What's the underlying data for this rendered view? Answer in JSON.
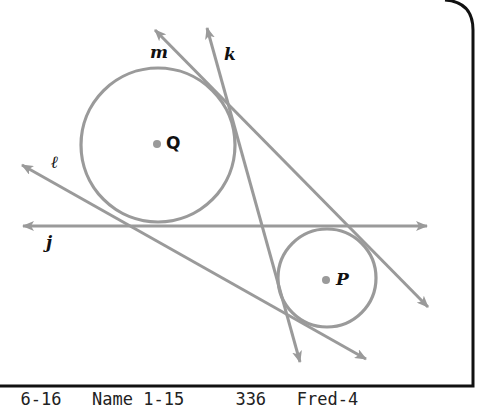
{
  "figure": {
    "type": "tangent-lines-circles",
    "line_color": "#9a9a9a",
    "frame_color": "#111111",
    "circles": [
      {
        "name": "Q",
        "cx": 158,
        "cy": 145,
        "r": 77
      },
      {
        "name": "P",
        "cx": 327,
        "cy": 278,
        "r": 49
      }
    ],
    "centers": [
      {
        "label": "Q",
        "x": 157,
        "y": 144
      },
      {
        "label": "P",
        "x": 326,
        "y": 280
      }
    ],
    "lines": [
      {
        "label": "m",
        "from": [
          155,
          30
        ],
        "to": [
          428,
          307
        ]
      },
      {
        "label": "k",
        "from": [
          207,
          28
        ],
        "to": [
          300,
          362
        ]
      },
      {
        "label": "ℓ",
        "from": [
          22,
          165
        ],
        "to": [
          366,
          359
        ]
      },
      {
        "label": "j",
        "from": [
          23,
          226
        ],
        "to": [
          427,
          226
        ]
      }
    ]
  },
  "labels": {
    "m": "m",
    "k": "k",
    "l": "ℓ",
    "j": "j",
    "Q": "Q",
    "P": "P"
  },
  "caption": {
    "text": "  6-16   Name 1-15     336   Fred-4"
  }
}
